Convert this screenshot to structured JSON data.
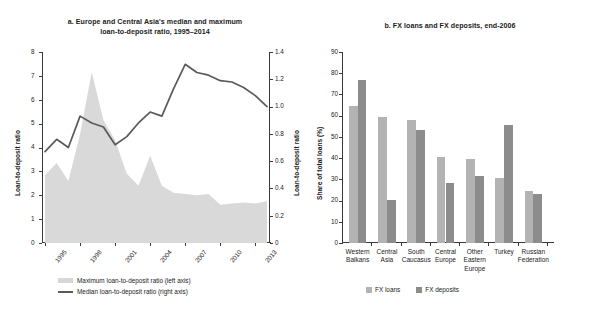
{
  "chart_data": [
    {
      "type": "area",
      "panel": "a",
      "title": "a. Europe and Central Asia's median and maximum loan-to-deposit ratio, 1995–2014",
      "title_line1": "a. Europe and Central Asia's median and maximum",
      "title_line2": "loan-to-deposit ratio, 1995–2014",
      "xlabel": "",
      "ylabel": "Loan-to-deposit ratio",
      "ylabel_right": "Loan-to-deposit ratio",
      "grid": false,
      "legend_position": "bottom",
      "ylim": [
        0,
        8
      ],
      "yticks": [
        0,
        1,
        2,
        3,
        4,
        5,
        6,
        7,
        8
      ],
      "ylim_right": [
        0,
        1.4
      ],
      "yticks_right": [
        "0",
        "0.2",
        "0.4",
        "0.6",
        "0.8",
        "1.0",
        "1.2",
        "1.4"
      ],
      "x": [
        1995,
        1996,
        1997,
        1998,
        1999,
        2000,
        2001,
        2002,
        2003,
        2004,
        2005,
        2006,
        2007,
        2008,
        2009,
        2010,
        2011,
        2012,
        2013,
        2014
      ],
      "xtick_labels": [
        "1995",
        "1998",
        "2001",
        "2004",
        "2007",
        "2010",
        "2013"
      ],
      "xtick_values": [
        1995,
        1998,
        2001,
        2004,
        2007,
        2010,
        2013
      ],
      "series": [
        {
          "name": "Maximum loan-to-deposit ratio (left axis)",
          "axis": "left",
          "style": "area",
          "color": "#d7d7d7",
          "values": [
            2.85,
            3.35,
            2.6,
            4.55,
            7.15,
            5.15,
            4.3,
            2.9,
            2.4,
            3.65,
            2.4,
            2.1,
            2.05,
            2.0,
            2.05,
            1.6,
            1.65,
            1.7,
            1.65,
            1.75
          ]
        },
        {
          "name": "Median loan-to-deposit ratio (right axis)",
          "axis": "right",
          "style": "line",
          "color": "#5a5a5a",
          "values": [
            0.67,
            0.76,
            0.7,
            0.93,
            0.88,
            0.85,
            0.72,
            0.78,
            0.88,
            0.96,
            0.93,
            1.13,
            1.31,
            1.25,
            1.23,
            1.19,
            1.18,
            1.14,
            1.08,
            1.0
          ]
        }
      ]
    },
    {
      "type": "bar",
      "panel": "b",
      "title": "b. FX loans and FX deposits, end-2006",
      "xlabel": "",
      "ylabel": "Share of total loans (%)",
      "grid": false,
      "legend_position": "bottom",
      "ylim": [
        0,
        90
      ],
      "yticks": [
        0,
        10,
        20,
        30,
        40,
        50,
        60,
        70,
        80,
        90
      ],
      "categories": [
        "Western Balkans",
        "Central Asia",
        "South Caucasus",
        "Central Europe",
        "Other Eastern Europe",
        "Turkey",
        "Russian Federation"
      ],
      "category_lines": [
        [
          "Western",
          "Balkans"
        ],
        [
          "Central",
          "Asia"
        ],
        [
          "South",
          "Caucasus"
        ],
        [
          "Central",
          "Europe"
        ],
        [
          "Other",
          "Eastern",
          "Europe"
        ],
        [
          "Turkey"
        ],
        [
          "Russian",
          "Federation"
        ]
      ],
      "series": [
        {
          "name": "FX loans",
          "color": "#b3b3b3",
          "values": [
            64.5,
            59.5,
            58.0,
            40.5,
            39.8,
            30.5,
            24.5
          ]
        },
        {
          "name": "FX deposits",
          "color": "#8c8c8c",
          "values": [
            76.7,
            20.4,
            53.3,
            28.2,
            31.5,
            55.8,
            23.0
          ]
        }
      ]
    }
  ]
}
